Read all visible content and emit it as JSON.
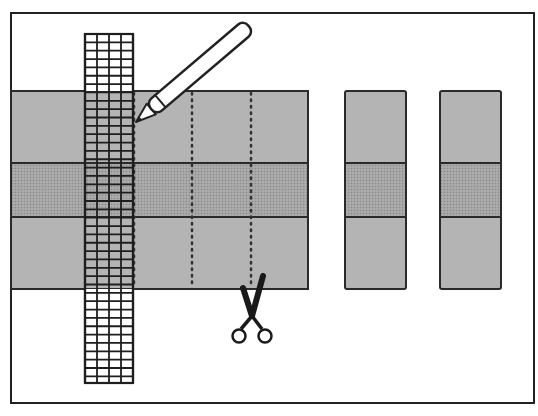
{
  "figure": {
    "colors": {
      "frame": "#222222",
      "background": "#ffffff",
      "light_band": "#b4b4b4",
      "dark_band": "#9a9a9a",
      "outline": "#2a2a2a",
      "ruler_fill": "#ffffff"
    },
    "panel": {
      "bands": [
        "light",
        "dark",
        "light"
      ],
      "dotted_cut_lines": 3
    },
    "cut_strips": [
      {
        "bands": [
          "light",
          "dark",
          "light"
        ]
      },
      {
        "bands": [
          "light",
          "dark",
          "light"
        ]
      }
    ],
    "ruler": {
      "columns": 4
    },
    "tools": [
      "pencil-icon",
      "scissors-icon"
    ]
  }
}
